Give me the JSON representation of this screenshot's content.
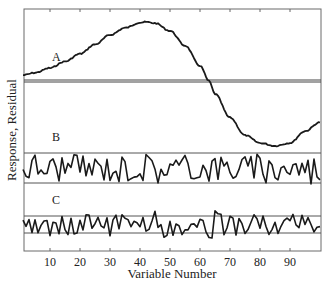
{
  "chart_data": {
    "type": "line",
    "title": "",
    "xlabel": "Variable Number",
    "ylabel": "Response, Residual",
    "xlim": [
      1,
      100
    ],
    "x_ticks": [
      10,
      20,
      30,
      40,
      50,
      60,
      70,
      80,
      90
    ],
    "grid": false,
    "legend": "none; series labeled inline",
    "series": [
      {
        "name": "A",
        "label_pos": {
          "x": 12,
          "panel": "top"
        },
        "description": "Smooth sinusoidal response curve; rises from slightly above zero line to a maximum near variable 42, crosses zero near variable 63, minimum near variable 85, rising at variable 100",
        "values_relative": [
          [
            1,
            0.1
          ],
          [
            5,
            0.14
          ],
          [
            10,
            0.22
          ],
          [
            15,
            0.33
          ],
          [
            20,
            0.46
          ],
          [
            25,
            0.62
          ],
          [
            30,
            0.78
          ],
          [
            35,
            0.9
          ],
          [
            40,
            0.99
          ],
          [
            42,
            1.0
          ],
          [
            45,
            0.98
          ],
          [
            50,
            0.85
          ],
          [
            55,
            0.6
          ],
          [
            60,
            0.26
          ],
          [
            63,
            0.0
          ],
          [
            65,
            -0.22
          ],
          [
            70,
            -0.62
          ],
          [
            75,
            -0.92
          ],
          [
            80,
            -1.05
          ],
          [
            85,
            -1.1
          ],
          [
            90,
            -1.05
          ],
          [
            95,
            -0.85
          ],
          [
            100,
            -0.7
          ]
        ],
        "reference_line": "double horizontal zero line"
      },
      {
        "name": "B",
        "label_pos": {
          "x": 12,
          "panel": "middle"
        },
        "description": "Random residual noise oscillating between two horizontal limit lines",
        "band": [
          -1,
          1
        ]
      },
      {
        "name": "C",
        "label_pos": {
          "x": 12,
          "panel": "bottom"
        },
        "description": "Random residual noise, frequently exceeding narrower horizontal limit lines",
        "band": [
          -1,
          1
        ]
      }
    ]
  },
  "labels": {
    "xlabel": "Variable Number",
    "ylabel": "Response, Residual",
    "series_a": "A",
    "series_b": "B",
    "series_c": "C",
    "ticks": [
      "10",
      "20",
      "30",
      "40",
      "50",
      "60",
      "70",
      "80",
      "90"
    ]
  },
  "colors": {
    "line": "#1a1a1a",
    "frame": "#555555",
    "reference": "#444444"
  }
}
